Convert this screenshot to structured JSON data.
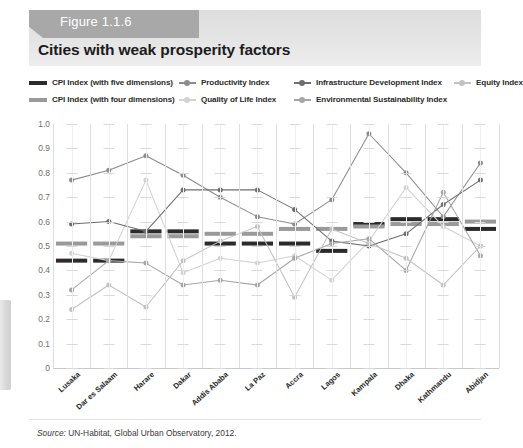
{
  "figure": {
    "tag": "Figure 1.1.6",
    "title": "Cities with weak prosperity factors",
    "source_prefix": "Source:",
    "source_text": " UN-Habitat, Global Urban Observatory, 2012."
  },
  "legend": {
    "items": [
      {
        "label": "CPI Index (with five dimensions)",
        "marker": "bar",
        "color": "#2b2b2b"
      },
      {
        "label": "CPI Index (with four dimensions)",
        "marker": "bar",
        "color": "#9a9a9a"
      },
      {
        "label": "Productivity Index",
        "marker": "line",
        "color": "#8c8c8c"
      },
      {
        "label": "Quality of Life Index",
        "marker": "line",
        "color": "#d2d2d2"
      },
      {
        "label": "Infrastructure Development Index",
        "marker": "line",
        "color": "#6e6e6e"
      },
      {
        "label": "Environmental Sustainability Index",
        "marker": "line",
        "color": "#a6a6a6"
      },
      {
        "label": "Equity Index",
        "marker": "line",
        "color": "#c2c2c2"
      }
    ]
  },
  "chart_data": {
    "type": "line",
    "title": "Cities with weak prosperity factors",
    "xlabel": "",
    "ylabel": "",
    "ylim": [
      0,
      1.0
    ],
    "ytick_labels": [
      "1.0",
      "0.9",
      "0.8",
      "0.7",
      "0.6",
      "0.5",
      "0.4",
      "0.3",
      "0.2",
      "0.1",
      "0"
    ],
    "yticks": [
      1.0,
      0.9,
      0.8,
      0.7,
      0.6,
      0.5,
      0.4,
      0.3,
      0.2,
      0.1,
      0
    ],
    "grid": true,
    "legend_position": "top",
    "categories": [
      "Lusaka",
      "Dar es Salaam",
      "Harare",
      "Dakar",
      "Addis Ababa",
      "La Paz",
      "Accra",
      "Lagos",
      "Kampala",
      "Dhaka",
      "Kathmandu",
      "Abidjan"
    ],
    "series": [
      {
        "name": "CPI Index (with five dimensions)",
        "style": "step-bar",
        "color": "#2b2b2b",
        "values": [
          0.44,
          0.44,
          0.56,
          0.56,
          0.51,
          0.51,
          0.51,
          0.48,
          0.59,
          0.61,
          0.61,
          0.57
        ]
      },
      {
        "name": "CPI Index (with four dimensions)",
        "style": "step-bar",
        "color": "#9a9a9a",
        "values": [
          0.51,
          0.51,
          0.54,
          0.54,
          0.55,
          0.55,
          0.57,
          0.57,
          0.58,
          0.59,
          0.59,
          0.6
        ]
      },
      {
        "name": "Productivity Index",
        "style": "line-marker",
        "color": "#8c8c8c",
        "values": [
          0.77,
          0.81,
          0.87,
          0.79,
          0.7,
          0.62,
          0.59,
          0.69,
          0.96,
          0.8,
          0.62,
          0.84
        ]
      },
      {
        "name": "Quality of Life Index",
        "style": "line-marker",
        "color": "#d2d2d2",
        "values": [
          0.47,
          0.44,
          0.77,
          0.39,
          0.45,
          0.43,
          0.46,
          0.36,
          0.52,
          0.74,
          0.58,
          0.5
        ]
      },
      {
        "name": "Infrastructure Development Index",
        "style": "line-marker",
        "color": "#6e6e6e",
        "values": [
          0.59,
          0.6,
          0.56,
          0.73,
          0.73,
          0.73,
          0.65,
          0.52,
          0.5,
          0.55,
          0.67,
          0.77
        ]
      },
      {
        "name": "Environmental Sustainability Index",
        "style": "line-marker",
        "color": "#a6a6a6",
        "values": [
          0.32,
          0.44,
          0.43,
          0.34,
          0.36,
          0.34,
          0.45,
          0.51,
          0.53,
          0.4,
          0.72,
          0.46
        ]
      },
      {
        "name": "Equity Index",
        "style": "line-marker",
        "color": "#c2c2c2",
        "values": [
          0.24,
          0.34,
          0.25,
          0.44,
          0.52,
          0.58,
          0.29,
          0.57,
          0.51,
          0.45,
          0.34,
          0.5
        ]
      }
    ]
  }
}
